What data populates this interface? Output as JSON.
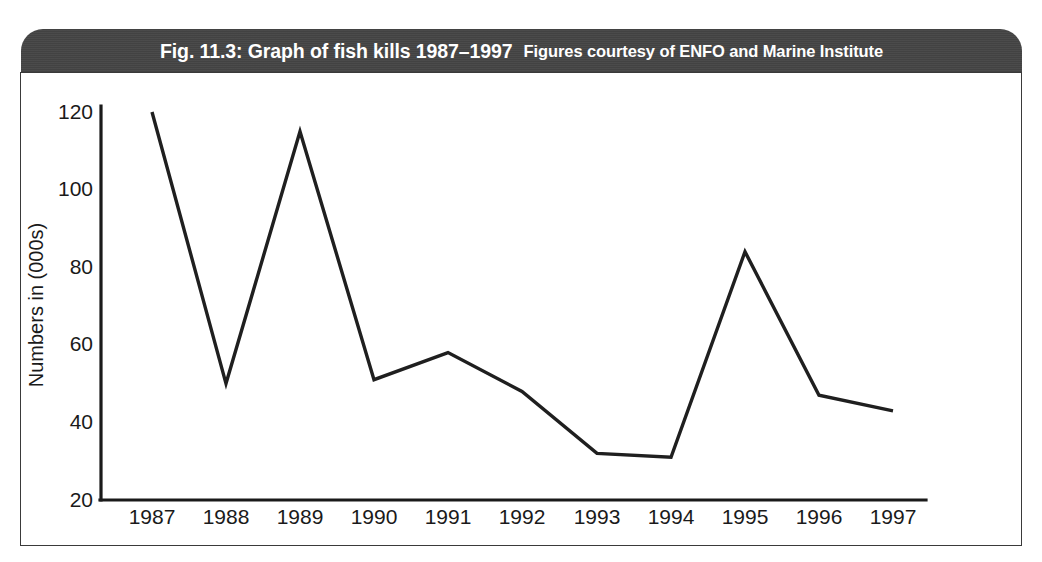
{
  "figure": {
    "caption_main": "Fig. 11.3: Graph of fish kills 1987–1997",
    "caption_credit": "Figures courtesy of ENFO and Marine Institute",
    "header_color": "#444444",
    "line_color": "#1f1f1f",
    "panel_border_color": "#3a3a3a"
  },
  "chart_data": {
    "type": "line",
    "title": "Fig. 11.3: Graph of fish kills 1987–1997",
    "subtitle": "Figures courtesy of ENFO and Marine Institute",
    "xlabel": "",
    "ylabel": "Numbers in (000s)",
    "categories": [
      "1987",
      "1988",
      "1989",
      "1990",
      "1991",
      "1992",
      "1993",
      "1994",
      "1995",
      "1996",
      "1997"
    ],
    "values": [
      120,
      50,
      115,
      51,
      58,
      48,
      32,
      31,
      84,
      47,
      43
    ],
    "series": [
      {
        "name": "Fish kills",
        "values": [
          120,
          50,
          115,
          51,
          58,
          48,
          32,
          31,
          84,
          47,
          43
        ]
      }
    ],
    "ylim": [
      20,
      120
    ],
    "yticks": [
      20,
      40,
      60,
      80,
      100,
      120
    ],
    "ytick_labels": [
      "20",
      "40",
      "60",
      "80",
      "100",
      "120"
    ],
    "xtick_labels": [
      "1987",
      "1988",
      "1989",
      "1990",
      "1991",
      "1992",
      "1993",
      "1994",
      "1995",
      "1996",
      "1997"
    ],
    "grid": false,
    "legend": "none",
    "markers": false
  }
}
